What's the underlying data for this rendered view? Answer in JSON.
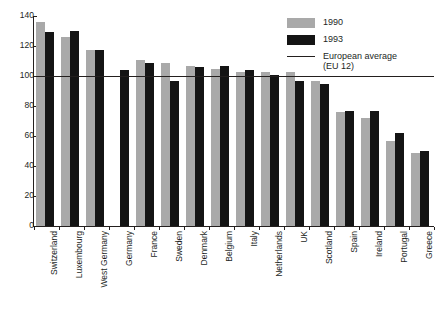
{
  "chart_data": {
    "type": "bar",
    "title": "",
    "subtitle": "",
    "xlabel": "",
    "ylabel": "",
    "ylim": [
      0,
      140
    ],
    "yticks": [
      0,
      20,
      40,
      60,
      80,
      100,
      120,
      140
    ],
    "ytick_labels": [
      "0",
      "20",
      "40",
      "60",
      "80",
      "100",
      "120",
      "140"
    ],
    "grid": false,
    "legend_position": "top-right",
    "categories": [
      "Switzerland",
      "Luxembourg",
      "West Germany",
      "Germany",
      "France",
      "Sweden",
      "Denmark",
      "Belgium",
      "Italy",
      "Netherlands",
      "UK",
      "Scotland",
      "Spain",
      "Ireland",
      "Portugal",
      "Greece"
    ],
    "series": [
      {
        "name": "1990",
        "color": "#a9a9a9",
        "values": [
          136,
          126,
          117.5,
          null,
          110.5,
          108.5,
          106.5,
          105,
          102.5,
          102.5,
          102.5,
          96.5,
          76,
          72,
          57,
          48.5
        ]
      },
      {
        "name": "1993",
        "color": "#141414",
        "values": [
          129.5,
          130,
          117.5,
          104,
          109,
          96.5,
          106,
          106.5,
          104,
          100.5,
          96.5,
          95,
          76.5,
          77,
          62,
          50
        ]
      }
    ],
    "reference_line": {
      "label": "European average",
      "label_line2": "(EU 12)",
      "value": 100,
      "color": "#231f1e"
    },
    "annotations": []
  },
  "legend": {
    "items": [
      {
        "label": "1990",
        "swatch": "gray-square-swatch"
      },
      {
        "label": "1993",
        "swatch": "black-square-swatch"
      },
      {
        "label": "European average",
        "label2": "(EU 12)",
        "swatch": "reference-line-swatch"
      }
    ]
  }
}
